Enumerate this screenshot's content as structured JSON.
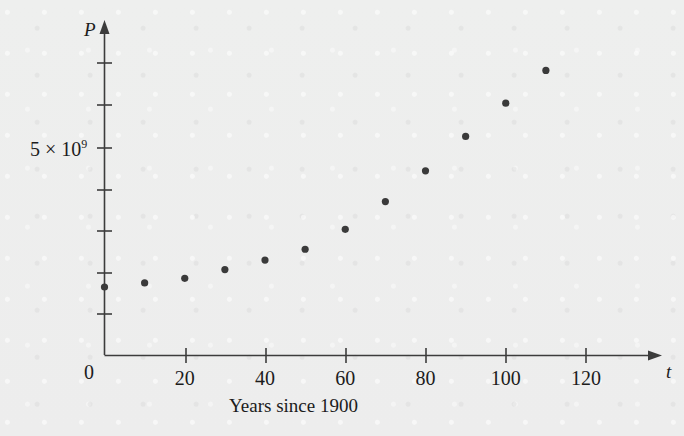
{
  "chart_data": {
    "type": "scatter",
    "title": "",
    "subtitle": "",
    "xlabel": "t",
    "ylabel": "P",
    "caption": "Years since 1900",
    "x": [
      0,
      10,
      20,
      30,
      40,
      50,
      60,
      70,
      80,
      90,
      100,
      110
    ],
    "values": [
      1650000000,
      1750000000,
      1860000000,
      2070000000,
      2300000000,
      2560000000,
      3040000000,
      3710000000,
      4450000000,
      5280000000,
      6080000000,
      6870000000
    ],
    "xticks": [
      "0",
      "20",
      "40",
      "60",
      "80",
      "100",
      "120"
    ],
    "xtick_values": [
      0,
      20,
      40,
      60,
      80,
      100,
      120
    ],
    "xlim": [
      0,
      130
    ],
    "ylim": [
      0,
      7500000000
    ],
    "yticks": [
      "5 × 10⁹"
    ],
    "ytick_values": [
      5000000000
    ],
    "ylabel_mantissa": "5 × 10",
    "ylabel_exponent": "9",
    "origin_label": "0",
    "grid": false,
    "legend": null,
    "axis_style": "arrow",
    "point_color": "#3a3a3a",
    "axis_color": "#3c3c3c"
  }
}
